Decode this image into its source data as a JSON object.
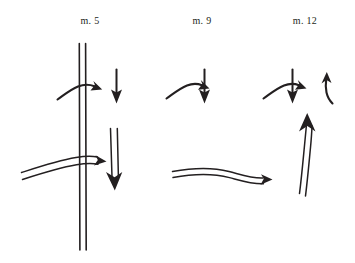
{
  "figure": {
    "background_color": "#ffffff",
    "ink_color": "#231f20",
    "groups": [
      {
        "label": "m. 5",
        "label_position": {
          "x": 70,
          "y": 15
        },
        "elements": [
          {
            "name": "barline-double-vertical",
            "kind": "double-vertical-line",
            "x": 82,
            "y_start": 43,
            "y_end": 250
          },
          {
            "name": "curved-arrow-right-upper",
            "kind": "curved-arrow",
            "direction": "right",
            "style": "single-line"
          },
          {
            "name": "down-arrow-upper",
            "kind": "straight-arrow",
            "direction": "down",
            "style": "single-line"
          },
          {
            "name": "curved-arrow-right-lower",
            "kind": "curved-arrow",
            "direction": "right",
            "style": "double-line"
          },
          {
            "name": "down-arrow-lower",
            "kind": "straight-arrow",
            "direction": "down",
            "style": "double-line"
          }
        ]
      },
      {
        "label": "m. 9",
        "label_position": {
          "x": 182,
          "y": 15
        },
        "elements": [
          {
            "name": "curved-arrow-right-upper",
            "kind": "curved-arrow",
            "direction": "right",
            "style": "single-line"
          },
          {
            "name": "down-arrow-upper",
            "kind": "straight-arrow",
            "direction": "down",
            "style": "single-line"
          },
          {
            "name": "curved-arrow-right-lower",
            "kind": "curved-arrow",
            "direction": "right",
            "style": "double-line"
          }
        ]
      },
      {
        "label": "m. 12",
        "label_position": {
          "x": 285,
          "y": 15
        },
        "elements": [
          {
            "name": "curved-arrow-right-upper",
            "kind": "curved-arrow",
            "direction": "right",
            "style": "single-line"
          },
          {
            "name": "down-arrow-upper",
            "kind": "straight-arrow",
            "direction": "down",
            "style": "single-line"
          },
          {
            "name": "hook-arrow-up",
            "kind": "curved-arrow",
            "direction": "up",
            "style": "single-line"
          },
          {
            "name": "up-arrow-lower",
            "kind": "curved-arrow",
            "direction": "up",
            "style": "double-line"
          }
        ]
      }
    ]
  },
  "labels": {
    "m5": "m. 5",
    "m9": "m. 9",
    "m12": "m. 12"
  }
}
